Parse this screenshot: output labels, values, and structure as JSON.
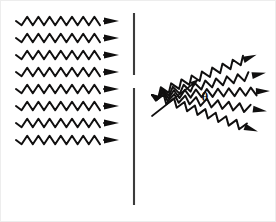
{
  "figure": {
    "background_color": "#ffffff",
    "ink_color": "#100f0f",
    "barrier_color": "#3b3b3b",
    "width": 276,
    "height": 222
  },
  "labels": {
    "theta": "θ",
    "theta_name": "diffraction angle theta",
    "theta_x": 205,
    "theta_y": 101,
    "theta_font_size": 13
  },
  "barrier": {
    "name": "slit-barrier",
    "x": 134,
    "thickness": 2.1,
    "upper_segment": {
      "y_start": 13,
      "y_end": 75
    },
    "lower_segment": {
      "y_start": 88,
      "y_end": 205
    },
    "slit_gap": {
      "y_start": 75,
      "y_end": 88
    }
  },
  "incident_waves": {
    "name": "incident-plane-waves",
    "count": 8,
    "x_start": 16,
    "x_end": 104,
    "arrow_tip_x": 119,
    "wavelength": 11.2,
    "amplitude": 4.2,
    "stroke_width": 2.0,
    "arrow_length": 15,
    "arrow_half_width": 3.6,
    "rows_y": [
      21,
      38,
      55,
      72,
      89,
      106,
      123,
      140
    ]
  },
  "diffracted_waves": {
    "name": "diffracted-waves",
    "count": 5,
    "origin_x": 152,
    "origin_y": 95,
    "wavelength": 11.0,
    "amplitude": 4.0,
    "stroke_width": 2.0,
    "arrow_length": 14,
    "arrow_half_width": 3.4,
    "rays": [
      {
        "label": "ray-upper-outer",
        "angle_deg": -21,
        "length": 112
      },
      {
        "label": "ray-upper-inner",
        "angle_deg": -11,
        "length": 116
      },
      {
        "label": "ray-center",
        "angle_deg": -2,
        "length": 118
      },
      {
        "label": "ray-lower-inner",
        "angle_deg": 8,
        "length": 116
      },
      {
        "label": "ray-lower-outer",
        "angle_deg": 19,
        "length": 112
      }
    ]
  },
  "angle_marker": {
    "name": "angle-indicator",
    "apex_x": 152,
    "apex_y": 116,
    "tip_x": 199,
    "tip_y": 79,
    "stroke_width": 1.7,
    "arrow_length": 9,
    "arrow_half_width": 3.0
  }
}
